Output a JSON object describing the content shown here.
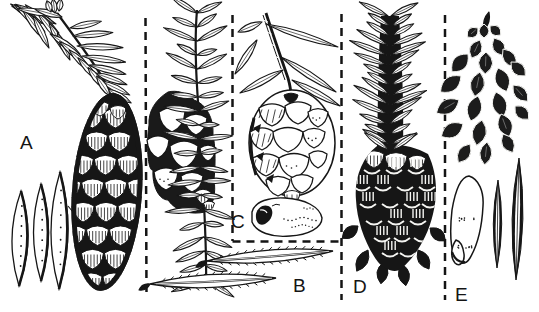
{
  "figure": {
    "paper_color": "#ffffff",
    "ink_color": "#161616",
    "kind": "botanical ink plate of conifer cones and needles",
    "panels": [
      {
        "label": "A",
        "subject": "branch with flat needles, large hanging seed cone, three detached needles"
      },
      {
        "label": "B",
        "subject": "bottlebrush shoot with small thick-scaled cone, two serrated needles below"
      },
      {
        "label": "C",
        "subject": "dashed inset: drooping twig with rounded open cone and winged seed"
      },
      {
        "label": "D",
        "subject": "shoot with upswept needles and dark mature cone"
      },
      {
        "label": "E",
        "subject": "dark closed cone, winged seed and two detached needles"
      }
    ]
  }
}
